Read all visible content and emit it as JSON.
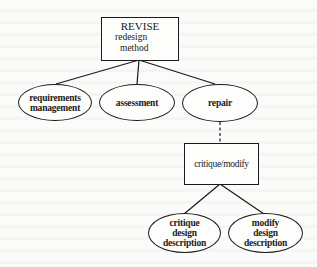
{
  "diagram": {
    "type": "task-decomposition-tree",
    "root": {
      "title": "REVISE",
      "line2": "redesign",
      "line3": "method"
    },
    "subtasks": [
      {
        "id": "requirements-management",
        "lines": [
          "requirements",
          "management"
        ]
      },
      {
        "id": "assessment",
        "lines": [
          "assessment"
        ]
      },
      {
        "id": "repair",
        "lines": [
          "repair"
        ]
      }
    ],
    "method_node": {
      "label": "critique/modify",
      "parent": "repair",
      "link_style": "dashed"
    },
    "method_subtasks": [
      {
        "id": "critique-design-description",
        "lines": [
          "critique",
          "design",
          "description"
        ]
      },
      {
        "id": "modify-design-description",
        "lines": [
          "modify",
          "design",
          "description"
        ]
      }
    ],
    "colors": {
      "stroke": "#1a1a1a",
      "background": "#fbfbf9"
    }
  }
}
